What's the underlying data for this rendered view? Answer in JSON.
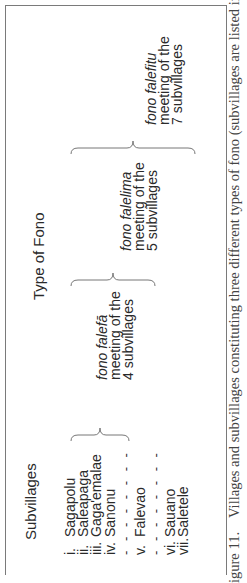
{
  "figure": {
    "column_headers": {
      "subvillages": "Subvillages",
      "type_of_fono": "Type of Fono"
    },
    "subvillages": [
      {
        "numeral": "i.",
        "name": "Sagapolu"
      },
      {
        "numeral": "ii.",
        "name": "Saleapaga"
      },
      {
        "numeral": "iii.",
        "name": "Gaga'emalae"
      },
      {
        "numeral": "iv.",
        "name": "Sanonu"
      },
      {
        "numeral": "v.",
        "name": "Falevao"
      },
      {
        "numeral": "vi.",
        "name": "Sauano"
      },
      {
        "numeral": "vii.",
        "name": "Saletele"
      }
    ],
    "separator": "- - - - - - - -",
    "fono_types": [
      {
        "prefix": "fono",
        "name": "falefā",
        "line2": "meeting of the",
        "line3": "4 subvillages"
      },
      {
        "prefix": "fono",
        "name": "falelima",
        "line2": "meeting of the",
        "line3": "5 subvillages"
      },
      {
        "prefix": "fono",
        "name": "falefitu",
        "line2": "meeting of the",
        "line3": "7 subvillages"
      }
    ]
  },
  "caption": {
    "label": "igure 11.",
    "text": "Villages and subvillages constituting three different types of fono (subvillages are listed in their"
  }
}
